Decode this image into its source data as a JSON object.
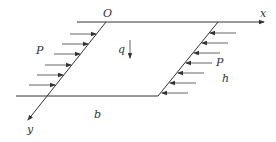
{
  "diagram": {
    "type": "parallelogram plate with in-plane edge loads",
    "labels": {
      "origin": "O",
      "x_axis": "x",
      "y_axis": "y",
      "load_left": "P",
      "load_right": "P",
      "distributed_load": "q",
      "width": "b",
      "height": "h"
    },
    "colors": {
      "line": "#333333",
      "arrow": "#555555",
      "background": "#ffffff"
    },
    "left_arrow_count": 6,
    "right_arrow_count": 6
  }
}
